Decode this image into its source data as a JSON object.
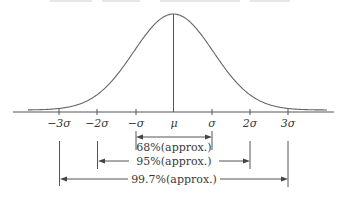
{
  "figure": {
    "ticks": [
      {
        "label": "−3σ",
        "x": 59
      },
      {
        "label": "−2σ",
        "x": 97
      },
      {
        "label": "−σ",
        "x": 136
      },
      {
        "label": "μ",
        "x": 174
      },
      {
        "label": "σ",
        "x": 212
      },
      {
        "label": "2σ",
        "x": 250
      },
      {
        "label": "3σ",
        "x": 288
      }
    ],
    "ranges": [
      {
        "label": "68%(approx.)",
        "from": "−σ",
        "to": "σ"
      },
      {
        "label": "95%(approx.)",
        "from": "−2σ",
        "to": "2σ"
      },
      {
        "label": "99.7%(approx.)",
        "from": "−3σ",
        "to": "3σ"
      }
    ],
    "colors": {
      "line": "#555555",
      "curve": "#666666",
      "text": "#3a3a3a",
      "background": "#ffffff"
    }
  },
  "chart_data": {
    "type": "line",
    "title": "",
    "xlabel": "",
    "ylabel": "",
    "x_tick_labels": [
      "−3σ",
      "−2σ",
      "−σ",
      "μ",
      "σ",
      "2σ",
      "3σ"
    ],
    "x_tick_values": [
      -3,
      -2,
      -1,
      0,
      1,
      2,
      3
    ],
    "xlim": [
      -4.1,
      4.2
    ],
    "grid": false,
    "series": [
      {
        "name": "normal density",
        "x": [
          -3.8,
          -3,
          -2,
          -1,
          0,
          1,
          2,
          3,
          4
        ],
        "y": [
          0.0003,
          0.0044,
          0.054,
          0.242,
          0.399,
          0.242,
          0.054,
          0.0044,
          0.0001
        ]
      }
    ],
    "annotations": [
      {
        "text": "68%(approx.)",
        "range": [
          -1,
          1
        ]
      },
      {
        "text": "95%(approx.)",
        "range": [
          -2,
          2
        ]
      },
      {
        "text": "99.7%(approx.)",
        "range": [
          -3,
          3
        ]
      }
    ]
  }
}
